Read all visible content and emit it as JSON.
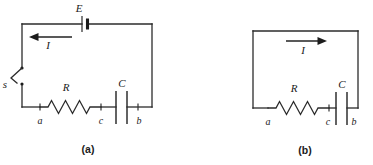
{
  "figure": {
    "type": "circuit-diagram",
    "background_color": "#ffffff",
    "line_color": "#2b2b2b",
    "panels": [
      {
        "id": "a",
        "caption": "(a)",
        "description": "RC charging circuit with EMF source and open switch",
        "labels": {
          "emf": "E",
          "current": "I",
          "switch": "s",
          "resistor": "R",
          "capacitor": "C",
          "node_a": "a",
          "node_c": "c",
          "node_b": "b"
        },
        "components": [
          "battery",
          "switch-open",
          "resistor",
          "capacitor"
        ],
        "current_direction": "left"
      },
      {
        "id": "b",
        "caption": "(b)",
        "description": "RC discharging circuit, no source, closed loop",
        "labels": {
          "current": "I",
          "resistor": "R",
          "capacitor": "C",
          "node_a": "a",
          "node_c": "c",
          "node_b": "b"
        },
        "components": [
          "resistor",
          "capacitor"
        ],
        "current_direction": "right"
      }
    ]
  }
}
